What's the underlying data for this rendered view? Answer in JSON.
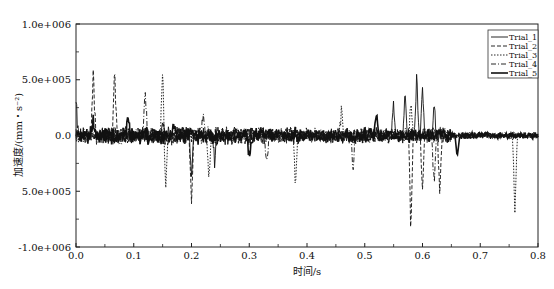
{
  "chart_data": {
    "type": "line",
    "title": "",
    "xlabel": "时间/s",
    "ylabel": "加速度/(mm・s⁻²)",
    "xlim": [
      0.0,
      0.8
    ],
    "ylim": [
      -1000000,
      1000000
    ],
    "grid": false,
    "legend_position": "upper right",
    "x_ticks": [
      "0.0",
      "0.1",
      "0.2",
      "0.3",
      "0.4",
      "0.5",
      "0.6",
      "0.7",
      "0.8"
    ],
    "y_ticks": [
      "1.0e+006",
      "5.0e+005",
      "0.0",
      "5.0e+005",
      "-1.0e+006"
    ],
    "y_tick_values": [
      1000000,
      500000,
      0,
      -500000,
      -1000000
    ],
    "series": [
      {
        "name": "Trial_1",
        "style": "solid",
        "peaks": [
          [
            0.0,
            300000
          ],
          [
            0.15,
            150000
          ],
          [
            0.2,
            -400000
          ],
          [
            0.24,
            -250000
          ],
          [
            0.55,
            350000
          ],
          [
            0.57,
            400000
          ],
          [
            0.59,
            550000
          ],
          [
            0.6,
            450000
          ],
          [
            0.62,
            300000
          ]
        ]
      },
      {
        "name": "Trial_2",
        "style": "dashed",
        "peaks": [
          [
            0.03,
            650000
          ],
          [
            0.067,
            600000
          ],
          [
            0.2,
            -700000
          ],
          [
            0.58,
            -900000
          ],
          [
            0.6,
            -500000
          ],
          [
            0.63,
            -600000
          ]
        ]
      },
      {
        "name": "Trial_3",
        "style": "dotted",
        "peaks": [
          [
            0.15,
            650000
          ],
          [
            0.155,
            -550000
          ],
          [
            0.23,
            -450000
          ],
          [
            0.38,
            -500000
          ],
          [
            0.46,
            250000
          ],
          [
            0.58,
            300000
          ],
          [
            0.76,
            -750000
          ]
        ]
      },
      {
        "name": "Trial_4",
        "style": "dashdot",
        "peaks": [
          [
            0.12,
            400000
          ],
          [
            0.22,
            200000
          ],
          [
            0.33,
            -300000
          ],
          [
            0.48,
            -350000
          ],
          [
            0.62,
            -500000
          ]
        ]
      },
      {
        "name": "Trial_5",
        "style": "thick",
        "peaks": [
          [
            0.03,
            150000
          ],
          [
            0.09,
            150000
          ],
          [
            0.17,
            100000
          ],
          [
            0.3,
            -250000
          ],
          [
            0.52,
            200000
          ],
          [
            0.66,
            -200000
          ]
        ]
      }
    ]
  }
}
